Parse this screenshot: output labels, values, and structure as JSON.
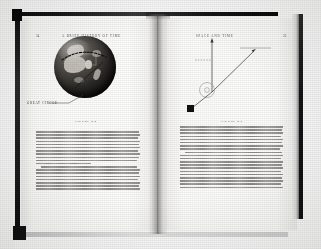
{
  "photo": {
    "subject": "open-book-spread",
    "book_title_running_head_left": "A BRIEF HISTORY OF TIME",
    "running_head_right": "SPACE AND TIME",
    "cover_color": "#111111",
    "page_color": "#fdfdfb"
  },
  "left_page": {
    "folio": "34",
    "running_head": "A BRIEF HISTORY OF TIME",
    "figure": {
      "caption": "FIGURE 2.8",
      "label": "GREAT CIRCLE",
      "kind": "globe-photograph",
      "description": "Photograph of the Earth with a dashed great-circle arc drawn across its surface"
    },
    "paragraphs": [
      {
        "indent": false,
        "lines": [
          98,
          99,
          97,
          99,
          98,
          99,
          97,
          99,
          98,
          96,
          52
        ]
      },
      {
        "indent": true,
        "lines": [
          96,
          99,
          98,
          99,
          97,
          99,
          98,
          99
        ]
      }
    ]
  },
  "right_page": {
    "folio": "35",
    "running_head": "SPACE AND TIME",
    "figure": {
      "caption": "FIGURE 2.9",
      "kind": "line-diagram",
      "labels": [
        "APPARENT POSITION OF STAR",
        "ACTUAL POSITION OF STAR",
        "SUN"
      ],
      "description": "Light from a distant star is bent as it passes near the sun, so the star appears at a different position"
    },
    "paragraphs": [
      {
        "indent": false,
        "lines": [
          99,
          98,
          99,
          97,
          99,
          98,
          99,
          96
        ]
      },
      {
        "indent": true,
        "lines": [
          98,
          99,
          97,
          99,
          98,
          99,
          97,
          99,
          98,
          99,
          97,
          99
        ]
      }
    ]
  }
}
